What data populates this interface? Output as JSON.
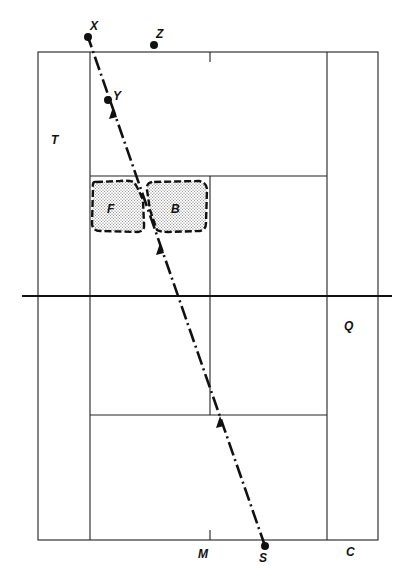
{
  "diagram": {
    "type": "tennis-court-serve-trajectory",
    "colors": {
      "line": "#222222",
      "ink": "#111111",
      "stipple": "#888888",
      "background": "#ffffff"
    },
    "points": {
      "X": {
        "label": "X",
        "x": 88,
        "y": 37
      },
      "Z": {
        "label": "Z",
        "x": 154,
        "y": 45
      },
      "Y": {
        "label": "Y",
        "x": 108,
        "y": 100
      },
      "S": {
        "label": "S",
        "x": 265,
        "y": 546
      }
    },
    "regions": {
      "T": {
        "label": "T"
      },
      "Q": {
        "label": "Q"
      },
      "M": {
        "label": "M"
      },
      "C": {
        "label": "C"
      },
      "F": {
        "label": "F"
      },
      "B": {
        "label": "B"
      }
    },
    "trajectory": {
      "from": "S",
      "to": "X",
      "style": "dash-dot",
      "arrows": 3
    }
  }
}
